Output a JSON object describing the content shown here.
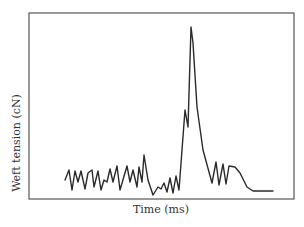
{
  "chart_data": {
    "type": "line",
    "title": "",
    "xlabel": "Time (ms)",
    "ylabel": "Weft tension (cN)",
    "grid": false,
    "legend": null,
    "axis_ticks": "none",
    "colors": {
      "line": "#2a2a2a",
      "frame": "#555555",
      "background": "#ffffff"
    },
    "frame_px": {
      "left": 29,
      "top": 13,
      "right": 294,
      "bottom": 199
    },
    "series": [
      {
        "name": "weft tension",
        "points_px": [
          [
            65,
            180
          ],
          [
            69,
            170
          ],
          [
            72,
            190
          ],
          [
            75,
            171
          ],
          [
            78,
            182
          ],
          [
            81,
            171
          ],
          [
            85,
            189
          ],
          [
            88,
            173
          ],
          [
            92,
            170
          ],
          [
            94,
            187
          ],
          [
            98,
            171
          ],
          [
            101,
            190
          ],
          [
            104,
            180
          ],
          [
            107,
            182
          ],
          [
            110,
            169
          ],
          [
            113,
            182
          ],
          [
            117,
            166
          ],
          [
            120,
            190
          ],
          [
            127,
            166
          ],
          [
            130,
            182
          ],
          [
            133,
            170
          ],
          [
            137,
            187
          ],
          [
            139,
            167
          ],
          [
            142,
            182
          ],
          [
            144,
            155
          ],
          [
            148,
            180
          ],
          [
            153,
            195
          ],
          [
            158,
            187
          ],
          [
            161,
            189
          ],
          [
            164,
            183
          ],
          [
            167,
            192
          ],
          [
            170,
            178
          ],
          [
            173,
            193
          ],
          [
            176,
            176
          ],
          [
            179,
            190
          ],
          [
            185,
            110
          ],
          [
            188,
            127
          ],
          [
            191,
            27
          ],
          [
            193,
            43
          ],
          [
            197,
            107
          ],
          [
            203,
            150
          ],
          [
            212,
            183
          ],
          [
            216,
            162
          ],
          [
            219,
            185
          ],
          [
            223,
            164
          ],
          [
            226,
            184
          ],
          [
            229,
            166
          ],
          [
            235,
            167
          ],
          [
            240,
            173
          ],
          [
            247,
            187
          ],
          [
            253,
            191
          ],
          [
            273,
            191
          ]
        ]
      }
    ],
    "annotations": []
  }
}
